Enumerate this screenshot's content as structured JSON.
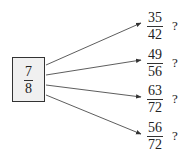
{
  "source": {
    "numerator": "7",
    "denominator": "8"
  },
  "targets": [
    {
      "numerator": "35",
      "denominator": "42",
      "mark": "?"
    },
    {
      "numerator": "49",
      "denominator": "56",
      "mark": "?"
    },
    {
      "numerator": "63",
      "denominator": "72",
      "mark": "?"
    },
    {
      "numerator": "56",
      "denominator": "72",
      "mark": "?"
    }
  ],
  "colors": {
    "box_fill": "#f0f0f0",
    "stroke": "#333333"
  }
}
